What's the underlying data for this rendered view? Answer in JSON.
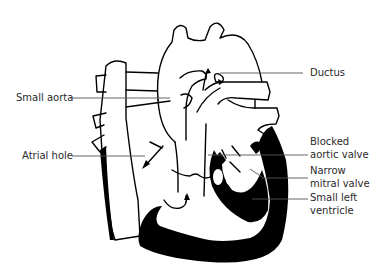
{
  "diagram": {
    "labels": {
      "small_aorta": "Small aorta",
      "atrial_hole": "Atrial hole",
      "ductus": "Ductus",
      "blocked_aortic_valve_line1": "Blocked",
      "blocked_aortic_valve_line2": "aortic valve",
      "narrow_mitral_valve_line1": "Narrow",
      "narrow_mitral_valve_line2": "mitral valve",
      "small_left_ventricle_line1": "Small left",
      "small_left_ventricle_line2": "ventricle"
    },
    "colors": {
      "ink": "#000000",
      "leader_line": "#555555",
      "text": "#2a2a2a",
      "background": "#ffffff"
    }
  }
}
